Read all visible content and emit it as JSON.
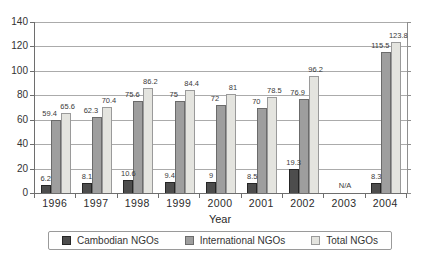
{
  "chart_data": {
    "type": "bar",
    "title": "",
    "xlabel": "Year",
    "ylabel": "",
    "ylim": [
      0,
      140
    ],
    "ytick_values": [
      0,
      20,
      40,
      60,
      80,
      100,
      120,
      140
    ],
    "ytick_labels": [
      "0",
      "20",
      "40",
      "60",
      "80",
      "100",
      "120",
      "140"
    ],
    "grid": true,
    "legend_position": "bottom",
    "bar_value_labels": true,
    "categories": [
      "1996",
      "1997",
      "1998",
      "1999",
      "2000",
      "2001",
      "2002",
      "2003",
      "2004"
    ],
    "series": [
      {
        "name": "Cambodian NGOs",
        "color": "#4d4d4d",
        "border_color": "#262626",
        "values": [
          6.2,
          8.1,
          10.6,
          9.4,
          9,
          8.5,
          19.3,
          null,
          8.3
        ],
        "labels": [
          "6.2",
          "8.1",
          "10.6",
          "9.4",
          "9",
          "8.5",
          "19.3",
          "",
          "8.3"
        ]
      },
      {
        "name": "International NGOs",
        "color": "#9e9e9e",
        "border_color": "#6b6b6b",
        "values": [
          59.4,
          62.3,
          75.6,
          75,
          72,
          70,
          76.9,
          null,
          115.5
        ],
        "labels": [
          "59.4",
          "62.3",
          "75.6",
          "75",
          "72",
          "70",
          "76.9",
          "",
          "115.5"
        ]
      },
      {
        "name": "Total NGOs",
        "color": "#e4e4df",
        "border_color": "#9a9a9a",
        "values": [
          65.6,
          70.4,
          86.2,
          84.4,
          81,
          78.5,
          96.2,
          null,
          123.8
        ],
        "labels": [
          "65.6",
          "70.4",
          "86.2",
          "84.4",
          "81",
          "78.5",
          "96.2",
          "",
          "123.8"
        ]
      }
    ],
    "missing_data": {
      "label": "N/A",
      "category_index": 7
    },
    "colors": {
      "gridline": "#ababab",
      "axis": "#6e6e6e",
      "text": "#333333",
      "background": "#ffffff"
    }
  }
}
